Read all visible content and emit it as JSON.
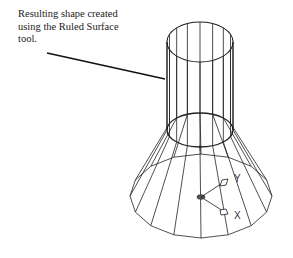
{
  "figure": {
    "caption_lines": [
      "Resulting shape created",
      "using the Ruled Surface",
      "tool."
    ],
    "ucs_icon": {
      "x_label": "X",
      "y_label": "Y"
    },
    "colors": {
      "line": "#222222",
      "background": "#ffffff"
    }
  }
}
